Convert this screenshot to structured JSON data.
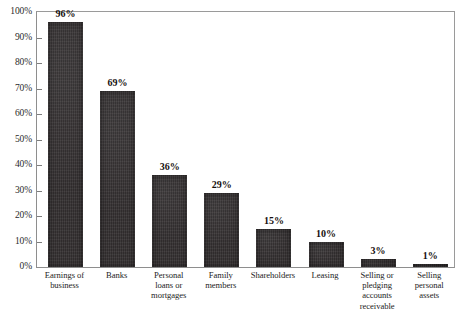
{
  "chart_data": {
    "type": "bar",
    "title": "",
    "subtitle": "",
    "xlabel": "",
    "ylabel": "",
    "ylim": [
      0,
      100
    ],
    "grid": false,
    "legend": "none",
    "orientation": "vertical",
    "value_suffix": "%",
    "categories": [
      "Earnings of\nbusiness",
      "Banks",
      "Personal\nloans or\nmortgages",
      "Family\nmembers",
      "Shareholders",
      "Leasing",
      "Selling or\npledging\naccounts\nreceivable",
      "Selling\npersonal\nassets"
    ],
    "values": [
      96,
      69,
      36,
      29,
      15,
      10,
      3,
      1
    ],
    "value_labels": [
      "96%",
      "69%",
      "36%",
      "29%",
      "15%",
      "10%",
      "3%",
      "1%"
    ],
    "y_ticks": [
      0,
      10,
      20,
      30,
      40,
      50,
      60,
      70,
      80,
      90,
      100
    ],
    "y_tick_labels": [
      "0%",
      "10%",
      "20%",
      "30%",
      "40%",
      "50%",
      "60%",
      "70%",
      "80%",
      "90%",
      "100%"
    ],
    "colors": {
      "bar": "#332f30",
      "frame": "#8e8e8e",
      "background": "#ffffff",
      "text": "#1a1a1a"
    }
  }
}
